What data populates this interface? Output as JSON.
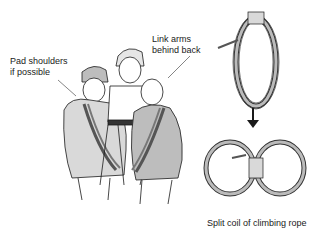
{
  "illustration": {
    "title": "Rope seat carry with split coil of climbing rope",
    "labels": {
      "pad_shoulders": "Pad shoulders\nif possible",
      "pad_shoulders_line1": "Pad shoulders",
      "pad_shoulders_line2": "if possible",
      "link_arms_line1": "Link arms",
      "link_arms_line2": "behind back"
    },
    "caption": "Split coil of climbing rope",
    "figures": {
      "left_rescuer": "person in beanie and jacket carrying coil over shoulder",
      "casualty": "seated person held between rescuers",
      "right_rescuer": "person in jacket carrying coil over shoulder"
    },
    "steps": [
      {
        "name": "coiled-rope",
        "description": "Coiled climbing rope"
      },
      {
        "name": "arrow",
        "description": "Downward arrow"
      },
      {
        "name": "split-coil",
        "description": "Coil split into figure-eight"
      }
    ],
    "colors": {
      "ink": "#1a1a1a",
      "shade_light": "#d9d9d9",
      "shade_mid": "#bdbdbd",
      "background": "#ffffff"
    }
  }
}
